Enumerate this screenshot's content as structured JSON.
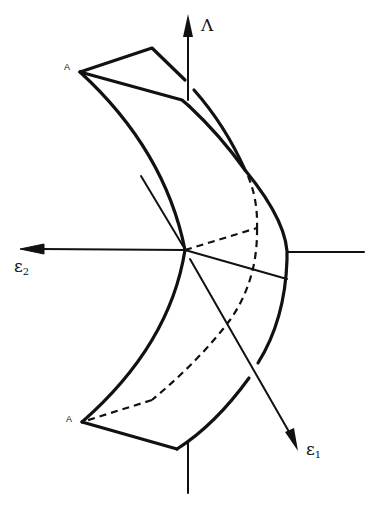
{
  "figure": {
    "type": "3d-surface-sketch",
    "background": "#ffffff",
    "ink": "#111111"
  },
  "axes": {
    "vertical": {
      "label": "Λ",
      "direction": "up"
    },
    "horizontal": {
      "label_main": "ε",
      "label_sub": "2",
      "direction": "left"
    },
    "oblique": {
      "label_main": "ε",
      "label_sub": "1",
      "direction": "down-right"
    }
  },
  "points": {
    "top_vertex": {
      "label": "A"
    },
    "bottom_vertex": {
      "label": "A"
    }
  }
}
